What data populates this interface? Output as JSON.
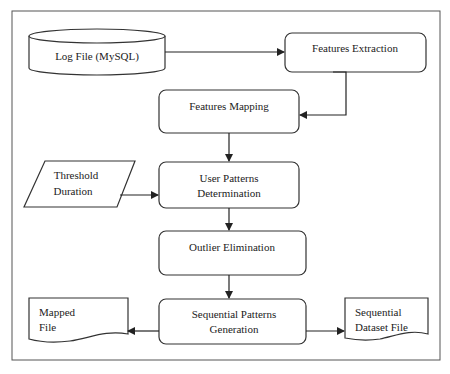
{
  "diagram": {
    "type": "flowchart",
    "colors": {
      "stroke": "#333333",
      "background": "#ffffff",
      "text": "#222222"
    },
    "nodes": {
      "log_file": {
        "shape": "cylinder",
        "label": "Log File (MySQL)"
      },
      "features_extraction": {
        "shape": "rounded-rect",
        "label": "Features Extraction"
      },
      "features_mapping": {
        "shape": "rounded-rect",
        "label": "Features Mapping"
      },
      "threshold_duration": {
        "shape": "parallelogram",
        "line1": "Threshold",
        "line2": "Duration"
      },
      "user_patterns": {
        "shape": "rounded-rect",
        "line1": "User Patterns",
        "line2": "Determination"
      },
      "outlier_elimination": {
        "shape": "rounded-rect",
        "label": "Outlier Elimination"
      },
      "sequential_patterns": {
        "shape": "rounded-rect",
        "line1": "Sequential Patterns",
        "line2": "Generation"
      },
      "mapped_file": {
        "shape": "document",
        "line1": "Mapped",
        "line2": "File"
      },
      "sequential_dataset": {
        "shape": "document",
        "line1": "Sequential",
        "line2": "Dataset File"
      }
    },
    "edges": [
      {
        "from": "Log File (MySQL)",
        "to": "Features Extraction"
      },
      {
        "from": "Features Extraction",
        "to": "Features Mapping"
      },
      {
        "from": "Features Mapping",
        "to": "User Patterns Determination"
      },
      {
        "from": "Threshold Duration",
        "to": "User Patterns Determination"
      },
      {
        "from": "User Patterns Determination",
        "to": "Outlier Elimination"
      },
      {
        "from": "Outlier Elimination",
        "to": "Sequential Patterns Generation"
      },
      {
        "from": "Sequential Patterns Generation",
        "to": "Mapped File"
      },
      {
        "from": "Sequential Patterns Generation",
        "to": "Sequential Dataset File"
      }
    ]
  }
}
